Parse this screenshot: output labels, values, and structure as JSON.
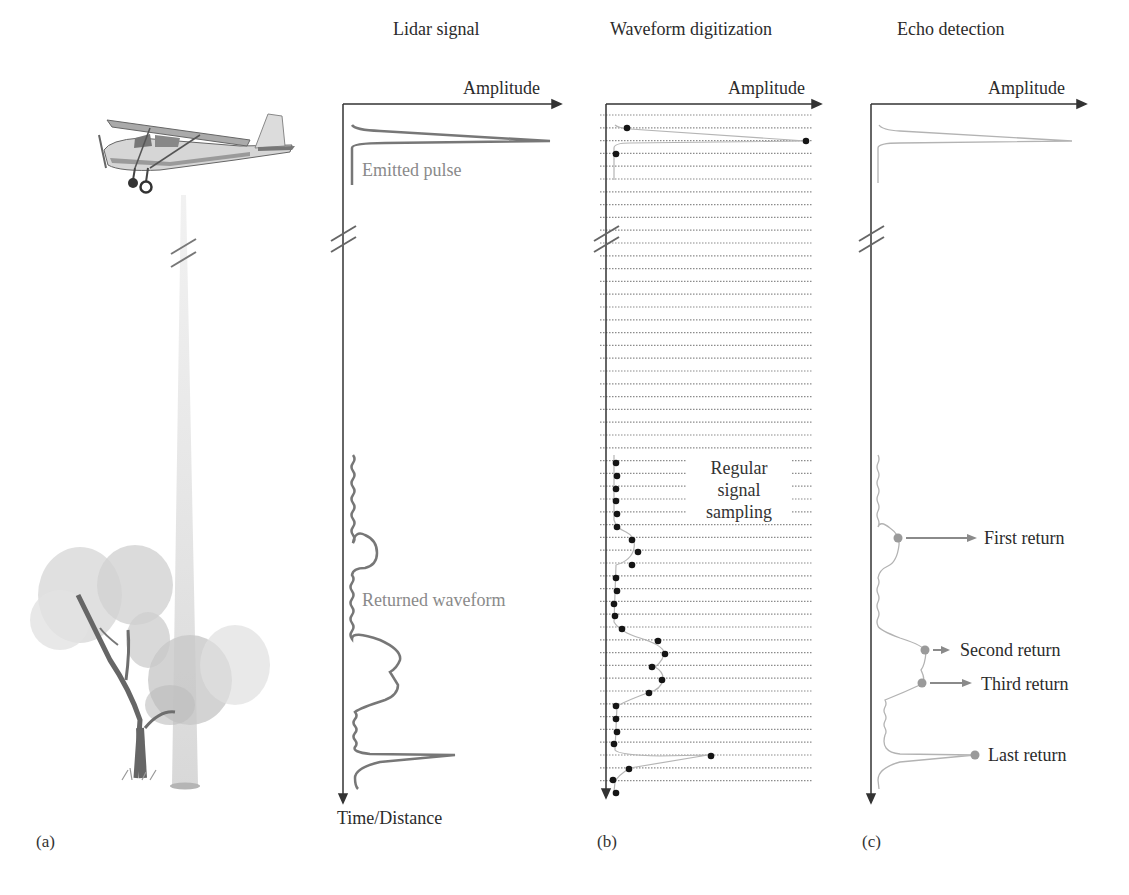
{
  "panels": {
    "a": {
      "label": "(a)",
      "illustrations": [
        "airplane",
        "laser-beam",
        "tree"
      ]
    },
    "lidar_signal": {
      "title": "Lidar signal",
      "x_axis_label": "Amplitude",
      "y_axis_label": "Time/Distance",
      "annotations": {
        "emitted": "Emitted pulse",
        "returned": "Returned waveform"
      }
    },
    "b": {
      "label": "(b)",
      "title": "Waveform digitization",
      "x_axis_label": "Amplitude",
      "annotation_line1": "Regular",
      "annotation_line2": "signal",
      "annotation_line3": "sampling"
    },
    "c": {
      "label": "(c)",
      "title": "Echo detection",
      "x_axis_label": "Amplitude",
      "returns": [
        "First return",
        "Second return",
        "Third return",
        "Last return"
      ]
    }
  },
  "colors": {
    "axis": "#333333",
    "waveform": "#777777",
    "light_waveform": "#b0b0b0",
    "sample_dot": "#1a1a1a",
    "return_dot": "#999999"
  }
}
